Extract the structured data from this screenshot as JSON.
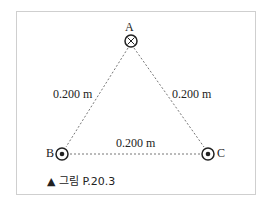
{
  "figure": {
    "caption": "▲ 그림 P.20.3",
    "points": [
      {
        "label": "A",
        "symbol": "cross",
        "meaning": "current into page"
      },
      {
        "label": "B",
        "symbol": "dot",
        "meaning": "current out of page"
      },
      {
        "label": "C",
        "symbol": "dot",
        "meaning": "current out of page"
      }
    ],
    "sides": {
      "AB": "0.200 m",
      "AC": "0.200 m",
      "BC": "0.200 m"
    }
  }
}
